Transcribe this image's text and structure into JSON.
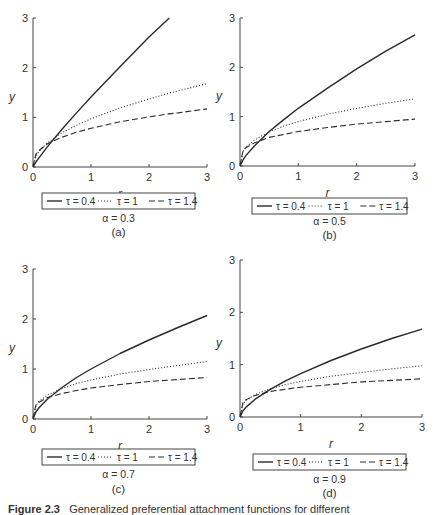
{
  "figure": {
    "caption_label": "Figure 2.3",
    "caption_text": "Generalized preferential attachment functions for different"
  },
  "colors": {
    "line": "#2b2b2b",
    "axis": "#444444",
    "legend_border": "#444444"
  },
  "chart_data": [
    {
      "panel": "(a)",
      "type": "line",
      "alpha_label": "α = 0.3",
      "sublabel": "(a)",
      "xlabel": "r",
      "ylabel": "y",
      "xlim": [
        0,
        3
      ],
      "ylim": [
        0,
        3
      ],
      "xticks": [
        0,
        1,
        2,
        3
      ],
      "yticks": [
        0,
        1,
        2,
        3
      ],
      "grid": false,
      "legend_position": "bottom",
      "x": [
        0,
        0.05,
        0.1,
        0.25,
        0.5,
        0.75,
        1,
        1.5,
        2,
        2.35,
        2.5,
        3
      ],
      "series": [
        {
          "name": "τ = 0.4",
          "style": "solid",
          "values": [
            0,
            0.1,
            0.18,
            0.41,
            0.76,
            1.09,
            1.41,
            2.02,
            2.62,
            3.0,
            null,
            null
          ]
        },
        {
          "name": "τ = 1",
          "style": "dotted",
          "values": [
            0,
            0.22,
            0.31,
            0.49,
            0.69,
            0.84,
            0.97,
            1.19,
            1.37,
            1.49,
            1.53,
            1.68
          ]
        },
        {
          "name": "τ = 1.4",
          "style": "dashed",
          "values": [
            0,
            0.26,
            0.33,
            0.47,
            0.6,
            0.7,
            0.78,
            0.91,
            1.01,
            1.07,
            1.09,
            1.17
          ]
        }
      ]
    },
    {
      "panel": "(b)",
      "type": "line",
      "alpha_label": "α = 0.5",
      "sublabel": "(b)",
      "xlabel": "r",
      "ylabel": "y",
      "xlim": [
        0,
        3
      ],
      "ylim": [
        0,
        3
      ],
      "xticks": [
        0,
        1,
        2,
        3
      ],
      "yticks": [
        0,
        1,
        2,
        3
      ],
      "grid": false,
      "legend_position": "bottom",
      "x": [
        0,
        0.05,
        0.1,
        0.25,
        0.5,
        0.75,
        1,
        1.5,
        2,
        2.5,
        3
      ],
      "series": [
        {
          "name": "τ = 0.4",
          "style": "solid",
          "values": [
            0,
            0.12,
            0.21,
            0.41,
            0.7,
            0.94,
            1.17,
            1.58,
            1.97,
            2.33,
            2.66
          ]
        },
        {
          "name": "τ = 1",
          "style": "dotted",
          "values": [
            0,
            0.29,
            0.38,
            0.53,
            0.69,
            0.81,
            0.9,
            1.05,
            1.17,
            1.27,
            1.36
          ]
        },
        {
          "name": "τ = 1.4",
          "style": "dashed",
          "values": [
            0,
            0.3,
            0.37,
            0.47,
            0.58,
            0.64,
            0.7,
            0.78,
            0.85,
            0.9,
            0.95
          ]
        }
      ]
    },
    {
      "panel": "(c)",
      "type": "line",
      "alpha_label": "α = 0.7",
      "sublabel": "(c)",
      "xlabel": "r",
      "ylabel": "y",
      "xlim": [
        0,
        3
      ],
      "ylim": [
        0,
        3
      ],
      "xticks": [
        0,
        1,
        2,
        3
      ],
      "yticks": [
        0,
        1,
        2,
        3
      ],
      "grid": false,
      "legend_position": "bottom",
      "x": [
        0,
        0.05,
        0.1,
        0.25,
        0.5,
        0.75,
        1,
        1.5,
        2,
        2.5,
        3
      ],
      "series": [
        {
          "name": "τ = 0.4",
          "style": "solid",
          "values": [
            0,
            0.14,
            0.22,
            0.4,
            0.63,
            0.83,
            1.0,
            1.31,
            1.58,
            1.83,
            2.07
          ]
        },
        {
          "name": "τ = 1",
          "style": "dotted",
          "values": [
            0,
            0.27,
            0.35,
            0.48,
            0.61,
            0.71,
            0.78,
            0.9,
            0.99,
            1.07,
            1.15
          ]
        },
        {
          "name": "τ = 1.4",
          "style": "dashed",
          "values": [
            0,
            0.28,
            0.33,
            0.43,
            0.51,
            0.57,
            0.62,
            0.69,
            0.75,
            0.79,
            0.83
          ]
        }
      ]
    },
    {
      "panel": "(d)",
      "type": "line",
      "alpha_label": "α = 0.9",
      "sublabel": "(d)",
      "xlabel": "r",
      "ylabel": "y",
      "xlim": [
        0,
        3
      ],
      "ylim": [
        0,
        3
      ],
      "xticks": [
        0,
        1,
        2,
        3
      ],
      "yticks": [
        0,
        1,
        2,
        3
      ],
      "grid": false,
      "legend_position": "bottom",
      "x": [
        0,
        0.05,
        0.1,
        0.25,
        0.5,
        0.75,
        1,
        1.5,
        2,
        2.5,
        3
      ],
      "series": [
        {
          "name": "τ = 0.4",
          "style": "solid",
          "values": [
            0,
            0.12,
            0.19,
            0.34,
            0.53,
            0.69,
            0.83,
            1.08,
            1.3,
            1.5,
            1.68
          ]
        },
        {
          "name": "τ = 1",
          "style": "dotted",
          "values": [
            0,
            0.25,
            0.32,
            0.43,
            0.54,
            0.62,
            0.68,
            0.78,
            0.85,
            0.92,
            0.98
          ]
        },
        {
          "name": "τ = 1.4",
          "style": "dashed",
          "values": [
            0,
            0.28,
            0.33,
            0.41,
            0.49,
            0.53,
            0.57,
            0.62,
            0.67,
            0.7,
            0.73
          ]
        }
      ]
    }
  ]
}
